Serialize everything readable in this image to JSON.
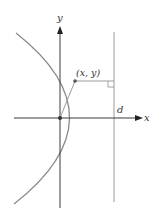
{
  "figure": {
    "type": "parabola-focus-directrix",
    "labels": {
      "y_axis": "y",
      "x_axis": "x",
      "point": "(x, y)",
      "directrix": "d"
    },
    "colors": {
      "axis": "#3a3a3a",
      "curve": "#8a8a8a",
      "directrix": "#9a9a9a",
      "segment": "#9a9a9a",
      "point": "#555555",
      "label": "#333333"
    },
    "geometry": {
      "origin_px": [
        60,
        118
      ],
      "focus_px": [
        60,
        118
      ],
      "point_px": [
        75,
        81
      ],
      "vertex_px": [
        88,
        118
      ],
      "directrix_x_px": 114,
      "curve_top_end_px": [
        16,
        33
      ],
      "curve_bottom_end_px": [
        14,
        204
      ]
    }
  }
}
